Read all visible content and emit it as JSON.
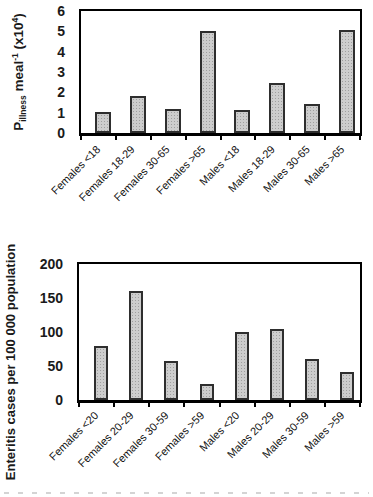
{
  "colors": {
    "background": "#ffffff",
    "axis": "#000000",
    "bar_fill": "#cdcdcd",
    "bar_stroke": "#2e2e2e",
    "text": "#1a1a1a"
  },
  "chart_data": [
    {
      "type": "bar",
      "title": "",
      "xlabel": "",
      "ylabel_text": "Pillness meal-1 (x104)",
      "ylabel_rich": {
        "base": "P",
        "base_subscript": "illness",
        "unit": " meal",
        "unit_exponent": "-1",
        "multiplier_open": " (x10",
        "multiplier_exponent": "4",
        "multiplier_close": ")"
      },
      "categories": [
        "Females <18",
        "Females 18-29",
        "Females 30-65",
        "Females >65",
        "Males <18",
        "Males 18-29",
        "Males 30-65",
        "Males >65"
      ],
      "values": [
        1.05,
        1.8,
        1.2,
        5.0,
        1.15,
        2.45,
        1.45,
        5.05
      ],
      "ylim": [
        0,
        6
      ],
      "yticks": [
        0,
        1,
        2,
        3,
        4,
        5,
        6
      ],
      "grid": false,
      "legend": "none"
    },
    {
      "type": "bar",
      "title": "",
      "xlabel": "",
      "ylabel": "Enteritis cases per 100 000 population",
      "categories": [
        "Females <20",
        "Females 20-29",
        "Females 30-59",
        "Females >59",
        "Males <20",
        "Males 20-29",
        "Males 30-59",
        "Males >59"
      ],
      "values": [
        80,
        160,
        58,
        23,
        100,
        104,
        61,
        41
      ],
      "ylim": [
        0,
        200
      ],
      "yticks": [
        0,
        50,
        100,
        150,
        200
      ],
      "grid": false,
      "legend": "none"
    }
  ]
}
